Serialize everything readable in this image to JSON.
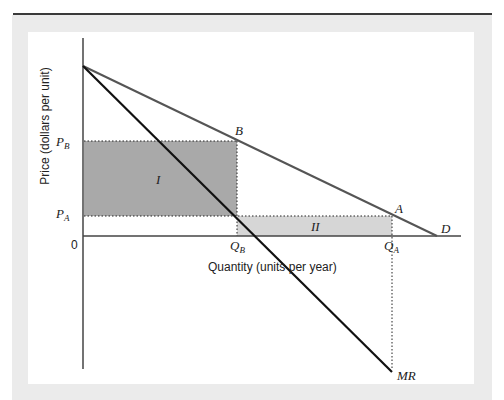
{
  "figure": {
    "y_axis_label": "Price (dollars per unit)",
    "x_axis_label": "Quantity (units per year)",
    "origin_label": "0",
    "price_labels": {
      "pb": "P",
      "pb_sub": "B",
      "pa": "P",
      "pa_sub": "A"
    },
    "quantity_labels": {
      "qb": "Q",
      "qb_sub": "B",
      "qa": "Q",
      "qa_sub": "A"
    },
    "point_labels": {
      "b": "B",
      "a": "A"
    },
    "curve_labels": {
      "demand": "D",
      "marginal_revenue": "MR"
    },
    "region_labels": {
      "region_1": "I",
      "region_2": "II"
    },
    "colors": {
      "frame": "#ebebeb",
      "region_1_fill": "#a9a9a9",
      "region_2_fill": "#d6d6d6",
      "demand_line": "#555555",
      "mr_line": "#111111",
      "axis": "#444444"
    }
  }
}
